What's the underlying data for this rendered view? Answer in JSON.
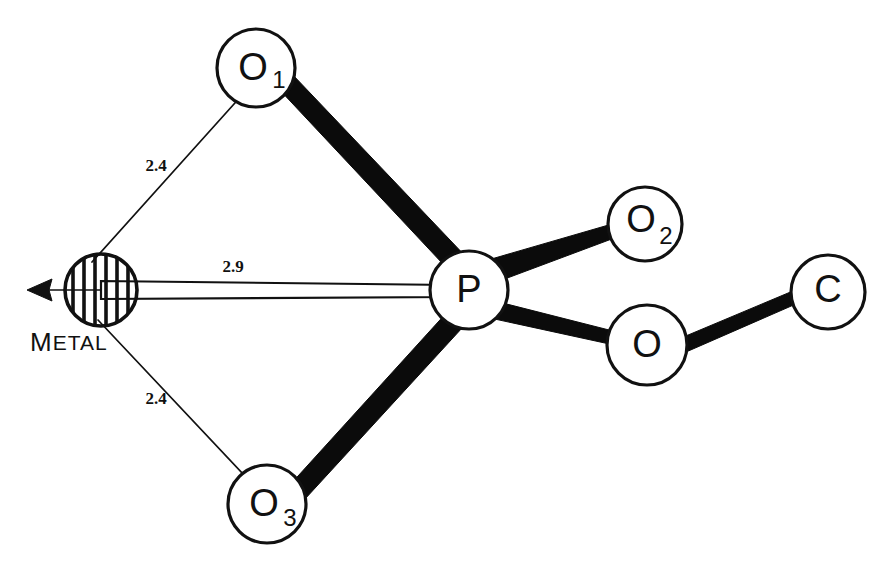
{
  "figure": {
    "caption_visible": false,
    "background_color": "#ffffff",
    "ink_color": "#111111",
    "width": 890,
    "height": 561
  },
  "diagram_data": {
    "type": "molecular-structure-diagram",
    "style": "hand-drawn ball-and-stick schematic",
    "atoms": [
      {
        "id": "metal",
        "label": "",
        "subscript": "",
        "caption": "METAL",
        "cx": 101,
        "cy": 290,
        "r": 37,
        "fill": "hatched",
        "hatch": "vertical"
      },
      {
        "id": "o1",
        "label": "O",
        "subscript": "1",
        "caption": "",
        "cx": 256,
        "cy": 68,
        "r": 39,
        "fill": "white",
        "hatch": "none"
      },
      {
        "id": "o3",
        "label": "O",
        "subscript": "3",
        "caption": "",
        "cx": 267,
        "cy": 504,
        "r": 39,
        "fill": "white",
        "hatch": "none"
      },
      {
        "id": "p",
        "label": "P",
        "subscript": "",
        "caption": "",
        "cx": 469,
        "cy": 290,
        "r": 39,
        "fill": "white",
        "hatch": "none"
      },
      {
        "id": "o2",
        "label": "O",
        "subscript": "2",
        "caption": "",
        "cx": 645,
        "cy": 224,
        "r": 37,
        "fill": "white",
        "hatch": "none"
      },
      {
        "id": "o_bridge",
        "label": "O",
        "subscript": "",
        "caption": "",
        "cx": 647,
        "cy": 345,
        "r": 40,
        "fill": "white",
        "hatch": "none"
      },
      {
        "id": "c",
        "label": "C",
        "subscript": "",
        "caption": "",
        "cx": 828,
        "cy": 292,
        "r": 37,
        "fill": "white",
        "hatch": "none"
      }
    ],
    "bonds": [
      {
        "id": "o1-p",
        "from": "o1",
        "to": "p",
        "style": "thick-solid",
        "width_from": 19,
        "width_to": 22
      },
      {
        "id": "o3-p",
        "from": "o3",
        "to": "p",
        "style": "thick-solid",
        "width_from": 19,
        "width_to": 22
      },
      {
        "id": "p-o2",
        "from": "p",
        "to": "o2",
        "style": "thick-solid",
        "width_from": 22,
        "width_to": 13
      },
      {
        "id": "p-o_bridge",
        "from": "p",
        "to": "o_bridge",
        "style": "thick-solid",
        "width_from": 22,
        "width_to": 13
      },
      {
        "id": "o_bridge-c",
        "from": "o_bridge",
        "to": "c",
        "style": "thick-solid",
        "width_from": 15,
        "width_to": 13
      },
      {
        "id": "metal-o1",
        "from": "metal",
        "to": "o1",
        "style": "thin-line",
        "label": "2.4"
      },
      {
        "id": "metal-o3",
        "from": "metal",
        "to": "o3",
        "style": "thin-line",
        "label": "2.4"
      },
      {
        "id": "metal-p",
        "from": "metal",
        "to": "p",
        "style": "double-thin-connector",
        "label": "2.9"
      }
    ],
    "distance_labels": [
      {
        "id": "dist-metal-o1",
        "text": "2.4",
        "x": 156,
        "y": 167
      },
      {
        "id": "dist-metal-p",
        "text": "2.9",
        "x": 233,
        "y": 268
      },
      {
        "id": "dist-metal-o3",
        "text": "2.4",
        "x": 156,
        "y": 400
      }
    ],
    "arrow": {
      "id": "metal-arrow",
      "direction": "left",
      "tip_x": 27,
      "tip_y": 290,
      "tail_x": 101,
      "tail_y": 290
    },
    "metal_caption": {
      "text": "METAL",
      "first_letter": "M",
      "rest": "ETAL",
      "x": 30,
      "y": 344
    }
  }
}
